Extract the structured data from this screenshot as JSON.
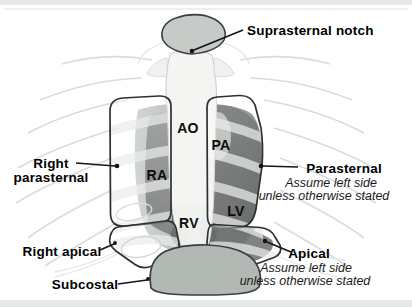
{
  "figure": {
    "annotations": {
      "suprasternal_notch": "Suprasternal notch",
      "right_parasternal": {
        "line1": "Right",
        "line2": "parasternal"
      },
      "parasternal": {
        "title": "Parasternal",
        "note_line1": "Assume left side",
        "note_line2": "unless otherwise stated"
      },
      "right_apical": "Right apical",
      "apical": {
        "title": "Apical",
        "note_line1": "Assume left side",
        "note_line2": "unless otherwise stated"
      },
      "subcostal": "Subcostal"
    },
    "structures": {
      "aorta": "AO",
      "pulmonary_artery": "PA",
      "right_atrium": "RA",
      "right_ventricle": "RV",
      "left_ventricle": "LV"
    },
    "colors": {
      "background": "#ffffff",
      "edge_band": "#e3e5e4",
      "window_outline": "#2c312f",
      "probe_site_fill": "#c6cbc8",
      "subcostal_fill": "#b2b9b5",
      "heart_dark": "#232725",
      "rib_faint": "#d8dcda",
      "label_text": "#000000"
    }
  }
}
